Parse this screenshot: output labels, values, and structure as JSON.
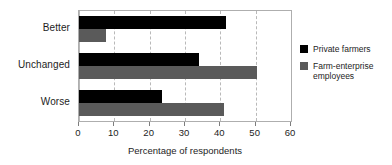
{
  "chart_data": {
    "type": "bar",
    "orientation": "horizontal",
    "title": "",
    "subtitle": "",
    "xlabel": "Percentage of respondents",
    "ylabel": "",
    "categories": [
      "Better",
      "Unchanged",
      "Worse"
    ],
    "series": [
      {
        "name": "Private farmers",
        "color": "#000000",
        "values": [
          41.5,
          34.0,
          23.5
        ]
      },
      {
        "name": "Farm-enterprise employees",
        "color": "#5a5a5a",
        "values": [
          7.5,
          50.5,
          41.0
        ]
      }
    ],
    "xlim": [
      0,
      60
    ],
    "xticks": [
      0,
      10,
      20,
      30,
      40,
      50,
      60
    ],
    "xticklabels": [
      "0",
      "10",
      "20",
      "30",
      "40",
      "50",
      "60"
    ],
    "grid": true,
    "grid_axis": "x",
    "grid_style": "dashed",
    "grid_color": "#b9b9b9",
    "legend_position": "right",
    "legend_entries": [
      "Private farmers",
      "Farm-enterprise employees"
    ],
    "frame_color": "#aeaeae",
    "background": "#ffffff"
  }
}
